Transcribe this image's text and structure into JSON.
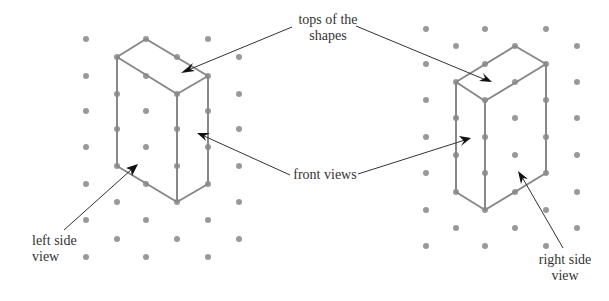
{
  "labels": {
    "tops": {
      "line1": "tops of the",
      "line2": "shapes"
    },
    "front": {
      "line1": "front views"
    },
    "left_side": {
      "line1": "left side",
      "line2": "view"
    },
    "right_side": {
      "line1": "right side",
      "line2": "view"
    }
  },
  "colors": {
    "dot": "#999999",
    "edge": "#888888",
    "leader": "#333333",
    "text": "#333333"
  },
  "left_grid": {
    "dots": [
      [
        86,
        39
      ],
      [
        146,
        39
      ],
      [
        208,
        39
      ],
      [
        117,
        57
      ],
      [
        177,
        57
      ],
      [
        239,
        57
      ],
      [
        86,
        76
      ],
      [
        146,
        76
      ],
      [
        208,
        76
      ],
      [
        117,
        94
      ],
      [
        177,
        94
      ],
      [
        239,
        94
      ],
      [
        86,
        111
      ],
      [
        146,
        111
      ],
      [
        208,
        111
      ],
      [
        117,
        129
      ],
      [
        177,
        129
      ],
      [
        239,
        129
      ],
      [
        86,
        147
      ],
      [
        146,
        147
      ],
      [
        208,
        147
      ],
      [
        117,
        166
      ],
      [
        177,
        166
      ],
      [
        239,
        166
      ],
      [
        86,
        184
      ],
      [
        146,
        184
      ],
      [
        208,
        184
      ],
      [
        117,
        202
      ],
      [
        177,
        202
      ],
      [
        239,
        202
      ],
      [
        86,
        220
      ],
      [
        146,
        220
      ],
      [
        208,
        220
      ],
      [
        117,
        239
      ],
      [
        177,
        239
      ],
      [
        239,
        239
      ],
      [
        86,
        257
      ],
      [
        146,
        257
      ],
      [
        208,
        257
      ]
    ]
  },
  "right_grid": {
    "dots": [
      [
        426,
        29
      ],
      [
        485,
        29
      ],
      [
        546,
        29
      ],
      [
        456,
        46
      ],
      [
        515,
        46
      ],
      [
        577,
        46
      ],
      [
        426,
        64
      ],
      [
        485,
        64
      ],
      [
        546,
        64
      ],
      [
        456,
        82
      ],
      [
        515,
        82
      ],
      [
        577,
        82
      ],
      [
        426,
        100
      ],
      [
        485,
        100
      ],
      [
        546,
        100
      ],
      [
        456,
        118
      ],
      [
        515,
        118
      ],
      [
        577,
        118
      ],
      [
        426,
        137
      ],
      [
        485,
        137
      ],
      [
        546,
        137
      ],
      [
        456,
        155
      ],
      [
        515,
        155
      ],
      [
        577,
        155
      ],
      [
        426,
        173
      ],
      [
        485,
        173
      ],
      [
        546,
        173
      ],
      [
        456,
        192
      ],
      [
        515,
        192
      ],
      [
        577,
        192
      ],
      [
        426,
        210
      ],
      [
        485,
        210
      ],
      [
        546,
        210
      ],
      [
        456,
        228
      ],
      [
        515,
        228
      ],
      [
        577,
        228
      ],
      [
        426,
        246
      ],
      [
        485,
        246
      ],
      [
        546,
        246
      ]
    ]
  }
}
